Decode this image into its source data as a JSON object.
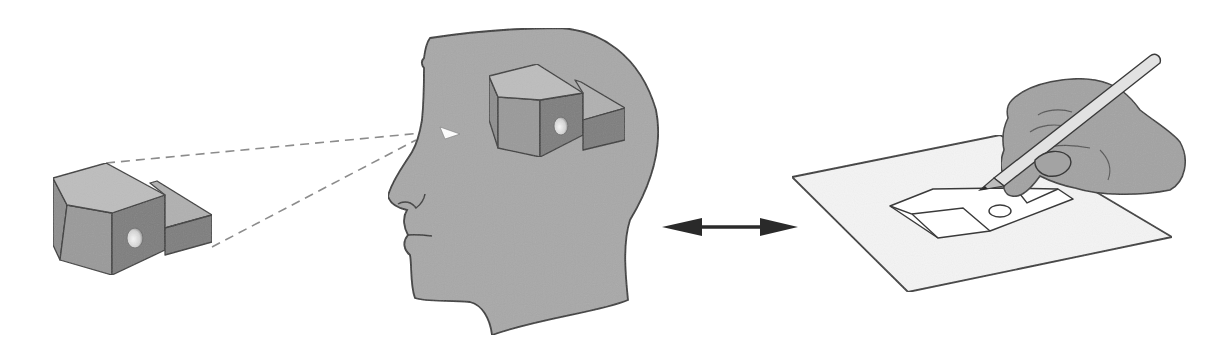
{
  "canvas": {
    "width": 1224,
    "height": 350,
    "background": "#ffffff"
  },
  "colors": {
    "outline": "#3a3a3a",
    "block_top": "#bdbdbd",
    "block_left": "#8e8e8e",
    "block_front": "#9a9a9a",
    "block_right": "#7e7e7e",
    "block_step_top": "#b0b0b0",
    "hole_light": "#f2f2f2",
    "hole_dark": "#8a8a8a",
    "head_fill": "#a8a8a8",
    "eye_fill": "#ffffff",
    "dash": "#8c8c8c",
    "arrow": "#2a2a2a",
    "paper_fill": "#f4f4f4",
    "sketch_fill": "#ffffff",
    "hand_fill": "#a3a3a3",
    "pencil_fill": "#e2e2e2",
    "pencil_lead": "#2a2a2a"
  },
  "elements": {
    "object_block": {
      "label": "physical-object",
      "faces": {
        "top": "53,178 106,163 165,195 112,213 67,205",
        "left": "53,178 67,205 60,260 53,245",
        "front_left": "67,205 112,213 112,275 60,260",
        "front_right": "112,213 165,195 165,250 112,275",
        "step_top": "150,183 157,181 212,215 165,228 165,195",
        "step_front": "165,228 212,215 212,242 165,255"
      },
      "hole": {
        "cx": 135,
        "cy": 238,
        "rx": 8,
        "ry": 10
      }
    },
    "sight_lines": [
      {
        "x1": 106,
        "y1": 163,
        "x2": 422,
        "y2": 133
      },
      {
        "x1": 212,
        "y1": 247,
        "x2": 416,
        "y2": 140
      }
    ],
    "head": {
      "outline": "M 430 38 C 470 32 520 28 560 28 C 600 30 640 55 656 110 C 664 150 648 190 630 220 C 622 245 626 280 628 300 C 600 312 540 318 492 335 C 490 318 482 305 470 302 C 450 300 425 302 415 298 C 410 285 412 265 410 255 C 404 250 402 242 408 235 C 404 228 402 218 407 210 C 398 208 390 204 388 196 C 392 180 404 165 412 152 C 418 142 420 132 422 120 C 424 100 424 80 424 68 C 421 64 421 61 424 58 C 425 50 427 42 430 38 Z",
      "nose_detail": "M 398 204 C 404 200 412 202 416 208 C 420 205 424 200 425 194",
      "mouth_line": "M 407 235 C 416 234 424 235 432 236",
      "eye": "440,127 445,139 460,134",
      "mental_block": {
        "faces": {
          "top": "489,76 537,64 583,93 540,100 498,97",
          "left": "489,76 498,97 498,148 489,120",
          "front_left": "498,97 540,100 540,157 498,148",
          "front_right": "540,100 583,93 583,135 540,157",
          "step_top": "575,80 581,82 625,108 583,120 583,93",
          "step_front": "583,120 625,108 625,140 583,150"
        },
        "hole": {
          "cx": 561,
          "cy": 126,
          "rx": 7,
          "ry": 9
        }
      }
    },
    "double_arrow": {
      "shaft": {
        "x1": 690,
        "y1": 227,
        "x2": 770,
        "y2": 227
      },
      "left_head": "662,227 702,218 702,236",
      "right_head": "798,227 760,218 760,236"
    },
    "paper": {
      "points": "792,177 1000,135 1172,237 908,292"
    },
    "sketch": {
      "outline": "890,206 933,189 1002,188 1058,189 1073,199 990,231 938,238",
      "top_face": "890,206 933,189 1002,188 963,208 912,214",
      "front_left": "890,206 912,214 938,238",
      "front_divider": "912,214 963,208 990,231",
      "step_line": "1020,194 1027,203 1058,189",
      "circle": {
        "cx": 1000,
        "cy": 211,
        "rx": 11,
        "ry": 6
      }
    },
    "hand": {
      "outline": "M 1012 100 C 1030 82 1070 76 1095 80 C 1118 84 1130 96 1140 110 C 1158 124 1172 132 1180 142 C 1190 160 1185 182 1170 190 C 1140 196 1100 196 1075 188 C 1060 185 1048 180 1040 176 C 1030 190 1020 198 1012 196 C 1004 195 1002 186 1005 178 C 1000 170 1000 160 1004 150 C 1002 140 1003 128 1008 118 C 1006 110 1008 104 1012 100 Z",
      "knuckle_lines": [
        "M 1038 115 C 1045 110 1060 108 1072 112",
        "M 1030 132 C 1040 125 1055 123 1068 127",
        "M 1040 150 C 1052 145 1070 144 1090 148",
        "M 1100 150 C 1110 160 1112 170 1108 180"
      ],
      "thumb": "M 1035 160 C 1045 150 1062 148 1070 158 C 1074 168 1062 178 1048 176 C 1040 174 1034 168 1035 160 Z"
    },
    "pencil": {
      "body": "M 994 178 L 1150 56 C 1155 52 1162 56 1160 63 L 1004 186 Z",
      "tip": "980,190 994,178 1004,186",
      "lead": "980,190 985,186 988,189"
    }
  },
  "caption_texts": []
}
